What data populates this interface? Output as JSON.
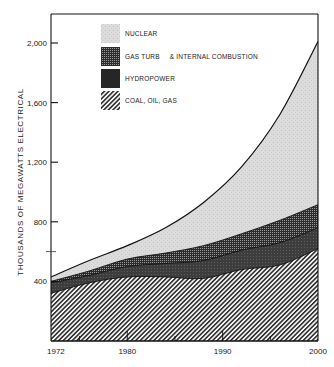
{
  "chart_data": {
    "type": "area",
    "stacked": true,
    "title": "",
    "xlabel": "",
    "ylabel": "THOUSANDS OF MEGAWATTS ELECTRICAL",
    "xlim": [
      1972,
      2000
    ],
    "ylim": [
      0,
      2200
    ],
    "x_ticks": [
      1972,
      1980,
      1990,
      2000
    ],
    "y_ticks": [
      400,
      800,
      1200,
      1600,
      2000
    ],
    "y_tick_labels": [
      "400",
      "800",
      "1,200",
      "1,600",
      "2,000"
    ],
    "x": [
      1972,
      1976,
      1980,
      1984,
      1988,
      1992,
      1996,
      2000
    ],
    "series": [
      {
        "name": "COAL, OIL, GAS",
        "pattern": "diagonal-hatch",
        "cumulative_top": [
          320,
          390,
          430,
          430,
          420,
          480,
          510,
          620
        ]
      },
      {
        "name": "HYDROPOWER",
        "pattern": "dark-solid",
        "cumulative_top": [
          390,
          440,
          500,
          520,
          540,
          610,
          660,
          760
        ]
      },
      {
        "name": "GAS TURB & INTERNAL COMBUSTION",
        "pattern": "dot-screen",
        "cumulative_top": [
          400,
          470,
          550,
          590,
          640,
          720,
          810,
          915
        ]
      },
      {
        "name": "NUCLEAR",
        "pattern": "light-stipple",
        "cumulative_top": [
          430,
          540,
          640,
          760,
          930,
          1170,
          1520,
          2010
        ]
      }
    ],
    "legend": [
      {
        "label": "NUCLEAR",
        "pattern": "light-stipple"
      },
      {
        "label": "GAS TURB     & INTERNAL COMBUSTION",
        "pattern": "dot-screen"
      },
      {
        "label": "HYDROPOWER",
        "pattern": "dark-solid"
      },
      {
        "label": "COAL, OIL, GAS",
        "pattern": "diagonal-hatch"
      }
    ],
    "legend_position": "upper-left inside",
    "grid": false
  },
  "labels": {
    "ylabel": "THOUSANDS OF MEGAWATTS ELECTRICAL",
    "legend_nuclear": "NUCLEAR",
    "legend_gas": "GAS TURB     & INTERNAL COMBUSTION",
    "legend_hydro": "HYDROPOWER",
    "legend_coal": "COAL, OIL, GAS"
  },
  "colors": {
    "frame": "#111111",
    "nuclear": "#d9d9d9",
    "gas": "#3a3a3a",
    "hydro": "#2a2a2a",
    "coal_lines": "#222222"
  }
}
